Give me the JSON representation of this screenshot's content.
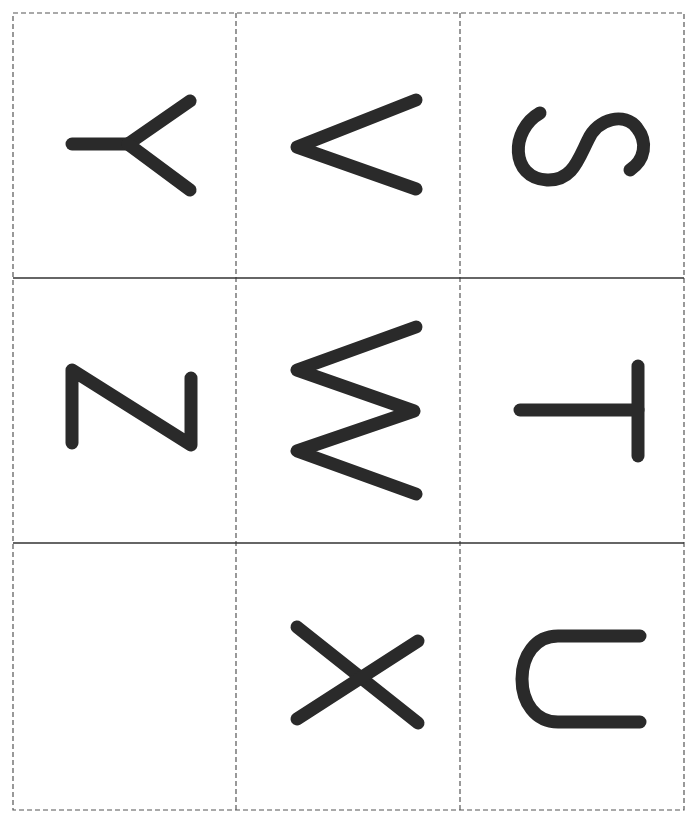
{
  "sheet": {
    "title": "Letter cards",
    "grid": {
      "left": 13,
      "top": 13,
      "right": 684,
      "bottom": 810,
      "col_lines": [
        236,
        460
      ],
      "row_lines": [
        278,
        543
      ],
      "border_color": "#555555",
      "cut_line_style": "dashed",
      "fold_line_style": "solid",
      "fold_line_color": "#333333"
    },
    "glyph_color": "#2a2a2a",
    "stroke_width": 13
  },
  "cards": [
    {
      "row": 0,
      "col": 0,
      "letter": "Y",
      "orientation": "rotated 90° counter-clockwise",
      "paths": [
        "M72 144 L128 144",
        "M128 144 L190 101",
        "M128 144 L190 190"
      ]
    },
    {
      "row": 0,
      "col": 1,
      "letter": "V",
      "orientation": "rotated 90° counter-clockwise",
      "paths": [
        "M416 100 L297 147 L416 189"
      ]
    },
    {
      "row": 0,
      "col": 2,
      "letter": "S",
      "orientation": "rotated 90° counter-clockwise",
      "paths": [
        "M540 113 C 510 130, 510 178, 547 180 C 572 181, 578 160, 588 140 C 598 118, 625 112, 637 128 C 648 142, 645 160, 630 170"
      ]
    },
    {
      "row": 1,
      "col": 0,
      "letter": "Z",
      "orientation": "rotated 90° counter-clockwise",
      "paths": [
        "M72 443 L72 370 L191 445 L191 378"
      ]
    },
    {
      "row": 1,
      "col": 1,
      "letter": "M",
      "orientation": "rotated 90° counter-clockwise",
      "paths": [
        "M416 327 L297 370 L414 411 L297 451 L416 494"
      ]
    },
    {
      "row": 1,
      "col": 2,
      "letter": "T",
      "orientation": "rotated 90° counter-clockwise",
      "paths": [
        "M520 410 L638 410",
        "M638 366 L638 456"
      ]
    },
    {
      "row": 2,
      "col": 0,
      "letter": "",
      "orientation": "blank",
      "paths": []
    },
    {
      "row": 2,
      "col": 1,
      "letter": "X",
      "orientation": "rotated 90° counter-clockwise",
      "paths": [
        "M297 627 L418 723",
        "M297 719 L418 641"
      ]
    },
    {
      "row": 2,
      "col": 2,
      "letter": "U",
      "orientation": "rotated 90° counter-clockwise",
      "paths": [
        "M640 636 L558 636 C 535 636, 522 656, 522 679 C 522 702, 535 722, 558 722 L640 722"
      ]
    }
  ]
}
